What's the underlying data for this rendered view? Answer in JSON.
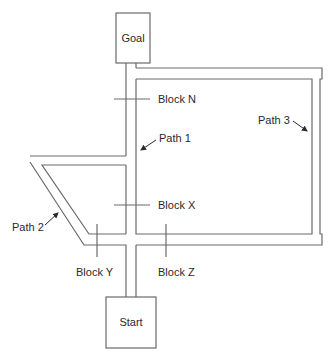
{
  "diagram": {
    "title": "",
    "boxes": {
      "goal": "Goal",
      "start": "Start"
    },
    "blocks": {
      "n": "Block N",
      "x": "Block X",
      "y": "Block Y",
      "z": "Block Z"
    },
    "paths": {
      "p1": "Path 1",
      "p2": "Path 2",
      "p3": "Path 3"
    },
    "colors": {
      "line": "#6a6a6a",
      "text": "#2a2a2a",
      "background": "#ffffff"
    }
  }
}
